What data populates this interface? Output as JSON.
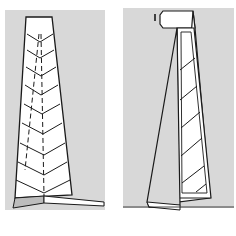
{
  "figure": {
    "type": "folding-instruction-diagram",
    "panels": [
      {
        "id": "left",
        "description": "Tapered strip with chevron crease lines and dashed fold lines, folded base at bottom",
        "background_color": "#d8d8d8",
        "chevron_count": 9
      },
      {
        "id": "right",
        "description": "Strip folded lengthwise, diagonal hatch lines on inner layer, top flap with marker",
        "background_color": "#d8d8d8",
        "marker_label": "I",
        "hatch_count": 6
      }
    ],
    "colors": {
      "line": "#1a1a1a",
      "paper": "#ffffff",
      "background": "#d8d8d8",
      "shadow": "#bcbcbc"
    }
  }
}
